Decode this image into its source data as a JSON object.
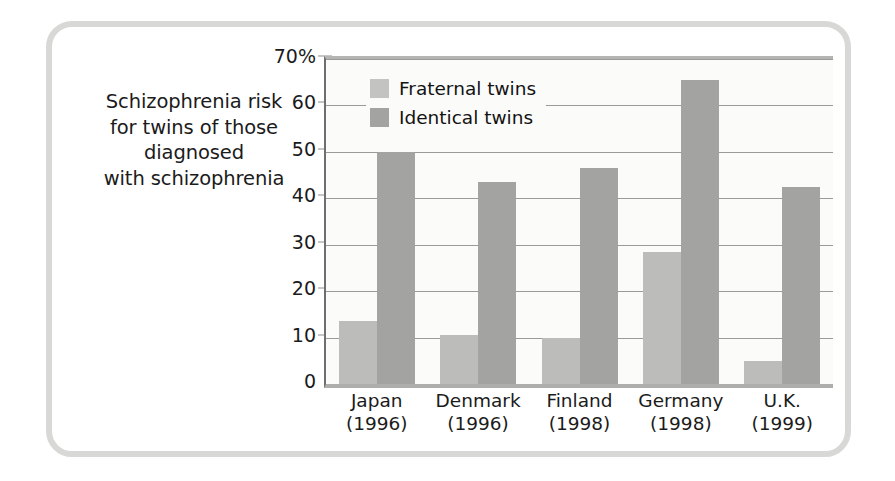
{
  "caption": {
    "lines": [
      "Schizophrenia risk",
      "for twins of those",
      "diagnosed",
      "with schizophrenia"
    ]
  },
  "legend": {
    "items": [
      {
        "label": "Fraternal twins",
        "color": "#c3c3c1"
      },
      {
        "label": "Identical twins",
        "color": "#a3a3a1"
      }
    ]
  },
  "axis": {
    "y_ticks": [
      "70%",
      "60",
      "50",
      "40",
      "30",
      "20",
      "10",
      "0"
    ],
    "y_tick_values": [
      70,
      60,
      50,
      40,
      30,
      20,
      10,
      0
    ]
  },
  "chart_data": {
    "type": "bar",
    "title": "Schizophrenia risk for twins of those diagnosed with schizophrenia",
    "xlabel": "",
    "ylabel": "",
    "ylim": [
      0,
      70
    ],
    "grid": true,
    "legend_position": "top-left-inside",
    "categories": [
      "Japan\n(1996)",
      "Denmark\n(1996)",
      "Finland\n(1998)",
      "Germany\n(1998)",
      "U.K.\n(1999)"
    ],
    "category_names": [
      "Japan",
      "Denmark",
      "Finland",
      "Germany",
      "U.K."
    ],
    "category_years": [
      "(1996)",
      "(1996)",
      "(1998)",
      "(1998)",
      "(1999)"
    ],
    "series": [
      {
        "name": "Fraternal twins",
        "color": "#bcbcba",
        "values": [
          13.5,
          10.5,
          10,
          28.5,
          5
        ]
      },
      {
        "name": "Identical twins",
        "color": "#a3a3a1",
        "values": [
          50,
          43.5,
          46.5,
          65.5,
          42.5
        ]
      }
    ]
  }
}
